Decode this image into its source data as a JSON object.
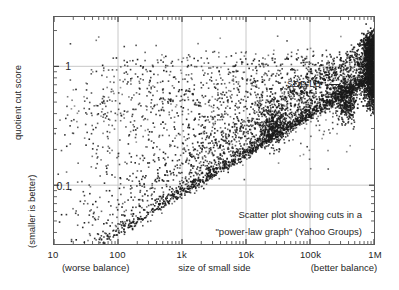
{
  "chart_data": {
    "type": "scatter",
    "title": "",
    "annotation": [
      "Scatter plot showing cuts in a",
      "\"power-law graph\" (Yahoo Groups)"
    ],
    "xlabel": "size of small side",
    "ylabel": "quotient cut score",
    "ylabel_sub": "(smaller is better)",
    "xlabel_left_note": "(worse balance)",
    "xlabel_right_note": "(better balance)",
    "xscale": "log",
    "yscale": "log",
    "xlim": [
      10,
      1000000
    ],
    "ylim": [
      0.032,
      2.6
    ],
    "grid": true,
    "legend": "none",
    "xticks": [
      {
        "value": 10,
        "label": "10"
      },
      {
        "value": 100,
        "label": "100"
      },
      {
        "value": 1000,
        "label": "1k"
      },
      {
        "value": 10000,
        "label": "10k"
      },
      {
        "value": 100000,
        "label": "100k"
      },
      {
        "value": 1000000,
        "label": "1M"
      }
    ],
    "yticks": [
      {
        "value": 1,
        "label": "1"
      },
      {
        "value": 0.1,
        "label": "0.1"
      }
    ],
    "marker": {
      "color": "#1a1a1a",
      "size": 1.6,
      "shape": "point"
    },
    "series_name": "cuts",
    "point_count": 2400,
    "annotations": [
      {
        "text": "SDP-LB",
        "x": 330000,
        "y": 0.56,
        "marker": "dash"
      }
    ]
  },
  "colors": {
    "ink": "#1f1f1f",
    "frame": "#5a5a5a",
    "grid": "#c8c8c8",
    "point": "#1a1a1a",
    "background": "#ffffff"
  }
}
